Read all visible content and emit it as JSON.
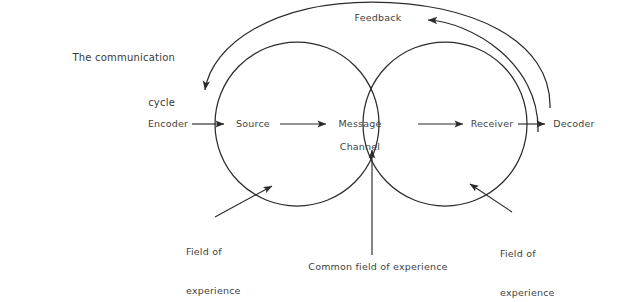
{
  "page": {
    "background_color": "#ffffff",
    "line_color": "#2b2b2b",
    "text_color": "#3f3f3f"
  },
  "title": {
    "line1": "The communication",
    "line2": "cycle"
  },
  "diagram": {
    "type": "venn-process-diagram",
    "labels": {
      "feedback": "Feedback",
      "encoder": "Encoder",
      "source": "Source",
      "message": "Message",
      "channel": "Channel",
      "receiver": "Receiver",
      "decoder": "Decoder",
      "field_of_experience_left_line1": "Field of",
      "field_of_experience_left_line2": "experience",
      "field_of_experience_right_line1": "Field of",
      "field_of_experience_right_line2": "experience",
      "common_field": "Common field of experience"
    },
    "circles": [
      {
        "name": "sender-field-of-experience",
        "cx": 297,
        "cy": 124,
        "r": 82
      },
      {
        "name": "receiver-field-of-experience",
        "cx": 445,
        "cy": 124,
        "r": 82
      }
    ],
    "flow_sequence": [
      "Encoder",
      "Source",
      "Message",
      "Channel",
      "Receiver",
      "Decoder"
    ],
    "feedback_direction": "right-to-left"
  }
}
